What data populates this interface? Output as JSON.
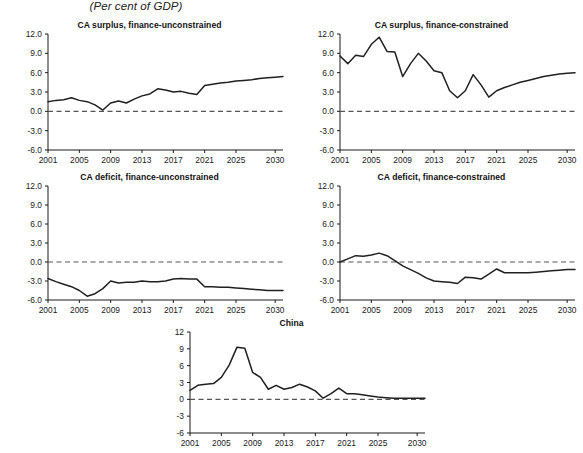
{
  "figure": {
    "title": "(Per cent of GDP)"
  },
  "chart_data": [
    {
      "id": "ca-surplus-finance-unconstrained",
      "type": "line",
      "title": "CA surplus, finance-unconstrained",
      "xlabel": "",
      "ylabel": "",
      "ylim": [
        -6.0,
        12.0
      ],
      "xlim": [
        2001,
        2031
      ],
      "yticks": [
        12.0,
        9.0,
        6.0,
        3.0,
        0.0,
        -3.0,
        -6.0
      ],
      "ytick_labels": [
        "12.0",
        "9.0",
        "6.0",
        "3.0",
        "0.0",
        "-3.0",
        "-6.0"
      ],
      "xticks": [
        2001,
        2005,
        2009,
        2013,
        2017,
        2021,
        2025,
        2030
      ],
      "xtick_labels": [
        "2001",
        "2005",
        "2009",
        "2013",
        "2017",
        "2021",
        "2025",
        "2030"
      ],
      "grid": false,
      "zero_line": true,
      "legend": null,
      "x": [
        2001,
        2002,
        2003,
        2004,
        2005,
        2006,
        2007,
        2008,
        2009,
        2010,
        2011,
        2012,
        2013,
        2014,
        2015,
        2016,
        2017,
        2018,
        2019,
        2020,
        2021,
        2022,
        2023,
        2024,
        2025,
        2026,
        2027,
        2028,
        2029,
        2030,
        2031
      ],
      "values": [
        1.5,
        1.7,
        1.8,
        2.1,
        1.7,
        1.5,
        1.0,
        0.2,
        1.3,
        1.6,
        1.3,
        1.9,
        2.4,
        2.7,
        3.5,
        3.3,
        3.0,
        3.1,
        2.8,
        2.6,
        4.0,
        4.2,
        4.4,
        4.5,
        4.7,
        4.8,
        4.9,
        5.1,
        5.2,
        5.3,
        5.4
      ]
    },
    {
      "id": "ca-surplus-finance-constrained",
      "type": "line",
      "title": "CA surplus, finance-constrained",
      "xlabel": "",
      "ylabel": "",
      "ylim": [
        -6.0,
        12.0
      ],
      "xlim": [
        2001,
        2031
      ],
      "yticks": [
        12.0,
        9.0,
        6.0,
        3.0,
        0.0,
        -3.0,
        -6.0
      ],
      "ytick_labels": [
        "12.0",
        "9.0",
        "6.0",
        "3.0",
        "0.0",
        "-3.0",
        "-6.0"
      ],
      "xticks": [
        2001,
        2005,
        2009,
        2013,
        2017,
        2021,
        2025,
        2030
      ],
      "xtick_labels": [
        "2001",
        "2005",
        "2009",
        "2013",
        "2017",
        "2021",
        "2025",
        "2030"
      ],
      "grid": false,
      "zero_line": true,
      "legend": null,
      "x": [
        2001,
        2002,
        2003,
        2004,
        2005,
        2006,
        2007,
        2008,
        2009,
        2010,
        2011,
        2012,
        2013,
        2014,
        2015,
        2016,
        2017,
        2018,
        2019,
        2020,
        2021,
        2022,
        2023,
        2024,
        2025,
        2026,
        2027,
        2028,
        2029,
        2030,
        2031
      ],
      "values": [
        8.6,
        7.4,
        8.7,
        8.5,
        10.4,
        11.5,
        9.3,
        9.2,
        5.4,
        7.4,
        9.0,
        7.8,
        6.3,
        6.0,
        3.2,
        2.1,
        3.2,
        5.7,
        4.1,
        2.2,
        3.2,
        3.7,
        4.1,
        4.5,
        4.8,
        5.1,
        5.4,
        5.6,
        5.8,
        5.9,
        6.0
      ]
    },
    {
      "id": "ca-deficit-finance-unconstrained",
      "type": "line",
      "title": "CA deficit, finance-unconstrained",
      "xlabel": "",
      "ylabel": "",
      "ylim": [
        -6.0,
        12.0
      ],
      "xlim": [
        2001,
        2031
      ],
      "yticks": [
        12.0,
        9.0,
        6.0,
        3.0,
        0.0,
        -3.0,
        -6.0
      ],
      "ytick_labels": [
        "12.0",
        "9.0",
        "6.0",
        "3.0",
        "0.0",
        "-3.0",
        "-6.0"
      ],
      "xticks": [
        2001,
        2005,
        2009,
        2013,
        2017,
        2021,
        2025,
        2030
      ],
      "xtick_labels": [
        "2001",
        "2005",
        "2009",
        "2013",
        "2017",
        "2021",
        "2025",
        "2030"
      ],
      "grid": false,
      "zero_line": true,
      "legend": null,
      "x": [
        2001,
        2002,
        2003,
        2004,
        2005,
        2006,
        2007,
        2008,
        2009,
        2010,
        2011,
        2012,
        2013,
        2014,
        2015,
        2016,
        2017,
        2018,
        2019,
        2020,
        2021,
        2022,
        2023,
        2024,
        2025,
        2026,
        2027,
        2028,
        2029,
        2030,
        2031
      ],
      "values": [
        -2.6,
        -3.1,
        -3.5,
        -3.9,
        -4.5,
        -5.4,
        -5.0,
        -4.2,
        -3.0,
        -3.3,
        -3.2,
        -3.2,
        -3.0,
        -3.1,
        -3.1,
        -3.0,
        -2.7,
        -2.6,
        -2.7,
        -2.7,
        -3.9,
        -3.9,
        -4.0,
        -4.0,
        -4.1,
        -4.2,
        -4.3,
        -4.4,
        -4.5,
        -4.5,
        -4.5
      ]
    },
    {
      "id": "ca-deficit-finance-constrained",
      "type": "line",
      "title": "CA deficit, finance-constrained",
      "xlabel": "",
      "ylabel": "",
      "ylim": [
        -6.0,
        12.0
      ],
      "xlim": [
        2001,
        2031
      ],
      "yticks": [
        12.0,
        9.0,
        6.0,
        3.0,
        0.0,
        -3.0,
        -6.0
      ],
      "ytick_labels": [
        "12.0",
        "9.0",
        "6.0",
        "3.0",
        "0.0",
        "-3.0",
        "-6.0"
      ],
      "xticks": [
        2001,
        2005,
        2009,
        2013,
        2017,
        2021,
        2025,
        2030
      ],
      "xtick_labels": [
        "2001",
        "2005",
        "2009",
        "2013",
        "2017",
        "2021",
        "2025",
        "2030"
      ],
      "grid": false,
      "zero_line": true,
      "legend": null,
      "x": [
        2001,
        2002,
        2003,
        2004,
        2005,
        2006,
        2007,
        2008,
        2009,
        2010,
        2011,
        2012,
        2013,
        2014,
        2015,
        2016,
        2017,
        2018,
        2019,
        2020,
        2021,
        2022,
        2023,
        2024,
        2025,
        2026,
        2027,
        2028,
        2029,
        2030,
        2031
      ],
      "values": [
        0.0,
        0.5,
        1.0,
        0.9,
        1.1,
        1.4,
        1.0,
        0.2,
        -0.6,
        -1.2,
        -1.8,
        -2.5,
        -3.0,
        -3.1,
        -3.2,
        -3.4,
        -2.4,
        -2.5,
        -2.7,
        -1.9,
        -1.1,
        -1.7,
        -1.7,
        -1.7,
        -1.7,
        -1.6,
        -1.5,
        -1.4,
        -1.3,
        -1.2,
        -1.2
      ]
    },
    {
      "id": "china",
      "type": "line",
      "title": "China",
      "xlabel": "",
      "ylabel": "",
      "ylim": [
        -6,
        12
      ],
      "xlim": [
        2001,
        2031
      ],
      "yticks": [
        12,
        9,
        6,
        3,
        0,
        -3,
        -6
      ],
      "ytick_labels": [
        "12",
        "9",
        "6",
        "3",
        "0",
        "-3",
        "-6"
      ],
      "xticks": [
        2001,
        2005,
        2009,
        2013,
        2017,
        2021,
        2025,
        2030
      ],
      "xtick_labels": [
        "2001",
        "2005",
        "2009",
        "2013",
        "2017",
        "2021",
        "2025",
        "2030"
      ],
      "grid": false,
      "zero_line": true,
      "legend": null,
      "x": [
        2001,
        2002,
        2003,
        2004,
        2005,
        2006,
        2007,
        2008,
        2009,
        2010,
        2011,
        2012,
        2013,
        2014,
        2015,
        2016,
        2017,
        2018,
        2019,
        2020,
        2021,
        2022,
        2023,
        2024,
        2025,
        2026,
        2027,
        2028,
        2029,
        2030,
        2031
      ],
      "values": [
        1.6,
        2.5,
        2.7,
        2.8,
        3.9,
        6.1,
        9.3,
        9.1,
        4.8,
        3.9,
        1.8,
        2.5,
        1.8,
        2.1,
        2.7,
        2.2,
        1.5,
        0.2,
        1.0,
        2.0,
        1.0,
        1.0,
        0.8,
        0.6,
        0.4,
        0.3,
        0.2,
        0.2,
        0.2,
        0.2,
        0.2
      ]
    }
  ]
}
